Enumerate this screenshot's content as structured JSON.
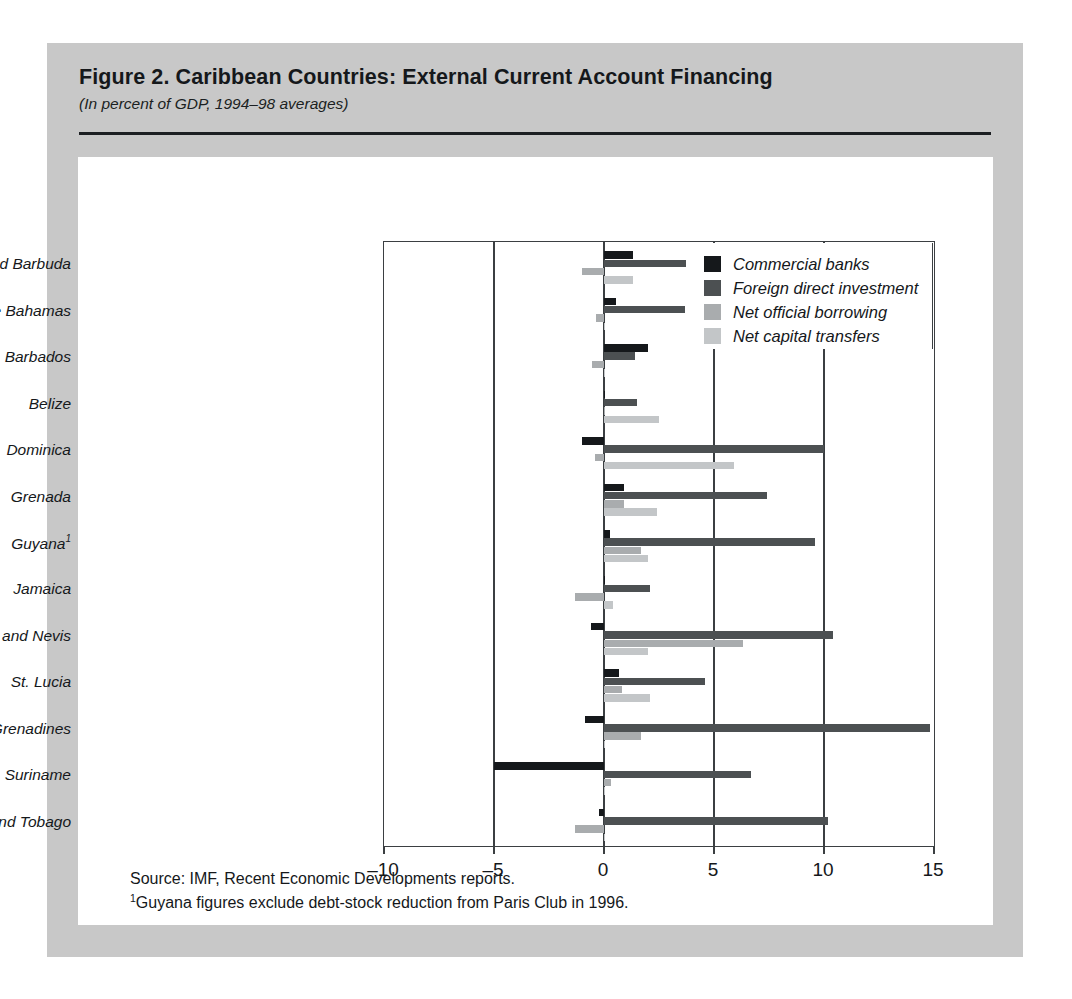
{
  "figure": {
    "title": "Figure 2.  Caribbean Countries: External Current Account Financing",
    "subtitle": "(In percent of GDP, 1994–98 averages)",
    "source_note": "Source: IMF, Recent Economic Developments reports.",
    "footnote_marker": "1",
    "footnote_text": "Guyana figures exclude debt-stock reduction from Paris Club in 1996."
  },
  "colors": {
    "commercial_banks": "#15181b",
    "foreign_direct_investment": "#4c5052",
    "net_official_borrowing": "#a9acae",
    "net_capital_transfers": "#c3c6c8",
    "panel_background": "#c8c8c8",
    "plot_background": "#ffffff",
    "axis": "#3b3f42"
  },
  "chart_data": {
    "type": "bar",
    "orientation": "horizontal",
    "title": "Figure 2.  Caribbean Countries: External Current Account Financing",
    "subtitle": "(In percent of GDP, 1994–98 averages)",
    "xlabel": "",
    "ylabel": "",
    "xlim": [
      -10,
      15
    ],
    "xticks": [
      -10,
      -5,
      0,
      5,
      10,
      15
    ],
    "xtick_labels": [
      "–10",
      "–5",
      "0",
      "5",
      "10",
      "15"
    ],
    "grid": "vertical-gridlines-at-ticks",
    "legend_position": "top-right-inside",
    "categories": [
      "Antigua and Barbuda",
      "The Bahamas",
      "Barbados",
      "Belize",
      "Dominica",
      "Grenada",
      "Guyana",
      "Jamaica",
      "St. Kitts and Nevis",
      "St. Lucia",
      "St. Vincent and the Grenadines",
      "Suriname",
      "Trinidad and Tobago"
    ],
    "category_footnotes": {
      "Guyana": "1"
    },
    "series": [
      {
        "name": "Commercial banks",
        "color": "#15181b",
        "values": [
          1.3,
          0.55,
          2.0,
          0.0,
          -1.0,
          0.9,
          0.25,
          0.0,
          -0.6,
          0.7,
          -0.85,
          -5.0,
          -0.25
        ]
      },
      {
        "name": "Foreign direct investment",
        "color": "#4c5052",
        "values": [
          4.4,
          3.7,
          1.4,
          1.5,
          10.0,
          7.4,
          9.6,
          2.1,
          10.4,
          4.6,
          14.8,
          6.7,
          10.2
        ]
      },
      {
        "name": "Net official borrowing",
        "color": "#a9acae",
        "values": [
          -1.0,
          -0.35,
          -0.55,
          0.05,
          -0.4,
          0.9,
          1.7,
          -1.3,
          6.3,
          0.8,
          1.7,
          0.3,
          -1.3
        ]
      },
      {
        "name": "Net capital transfers",
        "color": "#c3c6c8",
        "values": [
          1.3,
          0.0,
          0.0,
          2.5,
          5.9,
          2.4,
          2.0,
          0.4,
          2.0,
          2.1,
          0.0,
          0.0,
          0.0
        ]
      }
    ]
  },
  "legend": {
    "items": [
      {
        "label": "Commercial banks",
        "color": "#15181b"
      },
      {
        "label": "Foreign direct investment",
        "color": "#4c5052"
      },
      {
        "label": "Net official borrowing",
        "color": "#a9acae"
      },
      {
        "label": "Net capital transfers",
        "color": "#c3c6c8"
      }
    ]
  }
}
